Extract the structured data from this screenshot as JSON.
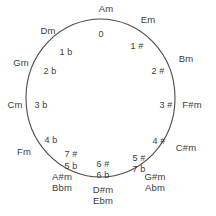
{
  "diagram": {
    "shape": "circle",
    "stroke_color": "#4a4a4a",
    "text_color": "#3b3b3b",
    "background_color": "#ffffff"
  },
  "outer_labels": [
    {
      "name": "Am",
      "text": "Am",
      "x": 106,
      "y": 4,
      "anchor": "center"
    },
    {
      "name": "Em",
      "text": "Em",
      "x": 148,
      "y": 15,
      "anchor": "center"
    },
    {
      "name": "Bm",
      "text": "Bm",
      "x": 186,
      "y": 54,
      "anchor": "center"
    },
    {
      "name": "F#m",
      "text": "F#m",
      "x": 192,
      "y": 100,
      "anchor": "center"
    },
    {
      "name": "C#m",
      "text": "C#m",
      "x": 186,
      "y": 143,
      "anchor": "center"
    },
    {
      "name": "G#m",
      "text": "G#m",
      "x": 155,
      "y": 172,
      "anchor": "center"
    },
    {
      "name": "Abm",
      "text": "Abm",
      "x": 155,
      "y": 183,
      "anchor": "center"
    },
    {
      "name": "D#m",
      "text": "D#m",
      "x": 103,
      "y": 185,
      "anchor": "center"
    },
    {
      "name": "Ebm",
      "text": "Ebm",
      "x": 103,
      "y": 196,
      "anchor": "center"
    },
    {
      "name": "A#m",
      "text": "A#m",
      "x": 62,
      "y": 172,
      "anchor": "center"
    },
    {
      "name": "Bbm",
      "text": "Bbm",
      "x": 62,
      "y": 183,
      "anchor": "center"
    },
    {
      "name": "Fm",
      "text": "Fm",
      "x": 24,
      "y": 147,
      "anchor": "center"
    },
    {
      "name": "Cm",
      "text": "Cm",
      "x": 15,
      "y": 100,
      "anchor": "center"
    },
    {
      "name": "Gm",
      "text": "Gm",
      "x": 21,
      "y": 58,
      "anchor": "center"
    },
    {
      "name": "Dm",
      "text": "Dm",
      "x": 48,
      "y": 26,
      "anchor": "center"
    }
  ],
  "inner_labels": [
    {
      "name": "0",
      "text": "0",
      "x": 101,
      "y": 29,
      "anchor": "center"
    },
    {
      "name": "1sharp",
      "text": "1 #",
      "x": 137,
      "y": 41,
      "anchor": "center"
    },
    {
      "name": "2sharp",
      "text": "2 #",
      "x": 158,
      "y": 66,
      "anchor": "center"
    },
    {
      "name": "3sharp",
      "text": "3 #",
      "x": 166,
      "y": 100,
      "anchor": "center"
    },
    {
      "name": "4sharp",
      "text": "4 #",
      "x": 159,
      "y": 136,
      "anchor": "center"
    },
    {
      "name": "5sharp",
      "text": "5 #",
      "x": 139,
      "y": 153,
      "anchor": "center"
    },
    {
      "name": "7flat",
      "text": "7 b",
      "x": 139,
      "y": 164,
      "anchor": "center"
    },
    {
      "name": "6sharp",
      "text": "6 #",
      "x": 103,
      "y": 159,
      "anchor": "center"
    },
    {
      "name": "6flat",
      "text": "6 b",
      "x": 103,
      "y": 170,
      "anchor": "center"
    },
    {
      "name": "7sharp",
      "text": "7 #",
      "x": 71,
      "y": 149,
      "anchor": "center"
    },
    {
      "name": "5flat",
      "text": "5 b",
      "x": 71,
      "y": 161,
      "anchor": "center"
    },
    {
      "name": "4flat",
      "text": "4 b",
      "x": 51,
      "y": 135,
      "anchor": "center"
    },
    {
      "name": "3flat",
      "text": "3 b",
      "x": 41,
      "y": 100,
      "anchor": "center"
    },
    {
      "name": "2flat",
      "text": "2 b",
      "x": 50,
      "y": 66,
      "anchor": "center"
    },
    {
      "name": "1flat",
      "text": "1 b",
      "x": 66,
      "y": 47,
      "anchor": "center"
    }
  ],
  "chart_data": {
    "type": "diagram",
    "positions": [
      {
        "angle_deg": 0,
        "key": "Am",
        "signature": "0"
      },
      {
        "angle_deg": 24,
        "key": "Em",
        "signature": "1 #"
      },
      {
        "angle_deg": 48,
        "key": "Bm",
        "signature": "2 #"
      },
      {
        "angle_deg": 72,
        "key": "F#m",
        "signature": "3 #"
      },
      {
        "angle_deg": 96,
        "key": "C#m",
        "signature": "4 #"
      },
      {
        "angle_deg": 120,
        "key": "G#m / Abm",
        "signature": "5 # / 7 b"
      },
      {
        "angle_deg": 144,
        "key": "D#m / Ebm",
        "signature": "6 # / 6 b"
      },
      {
        "angle_deg": 168,
        "key": "A#m / Bbm",
        "signature": "7 # / 5 b"
      },
      {
        "angle_deg": 216,
        "key": "Fm",
        "signature": "4 b"
      },
      {
        "angle_deg": 240,
        "key": "Cm",
        "signature": "3 b"
      },
      {
        "angle_deg": 264,
        "key": "Gm",
        "signature": "2 b"
      },
      {
        "angle_deg": 288,
        "key": "Dm",
        "signature": "1 b"
      }
    ]
  }
}
